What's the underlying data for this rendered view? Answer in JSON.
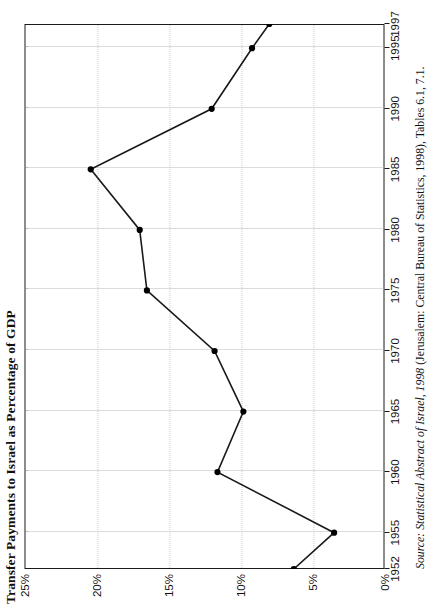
{
  "chart_data": {
    "type": "line",
    "title": "Transfer Payments to Israel as Percentage of GDP",
    "xlabel": "",
    "ylabel": "",
    "x": [
      1952,
      1955,
      1960,
      1965,
      1970,
      1975,
      1980,
      1985,
      1990,
      1995,
      1997
    ],
    "values": [
      6.3,
      3.5,
      11.6,
      9.8,
      11.8,
      16.5,
      17.0,
      20.4,
      12.0,
      9.2,
      8.0
    ],
    "xticks": [
      "1952",
      "1955",
      "1960",
      "1965",
      "1970",
      "1975",
      "1980",
      "1985",
      "1990",
      "1995",
      "1997"
    ],
    "yticks": [
      "0%",
      "5%",
      "10%",
      "15%",
      "20%",
      "25%"
    ],
    "ytick_values": [
      0,
      5,
      10,
      15,
      20,
      25
    ],
    "ylim": [
      0,
      25
    ],
    "xlim": [
      1952,
      1997
    ],
    "grid": true,
    "legend": "none",
    "orientation": "rotated-90-ccw",
    "marker": "filled-circle",
    "line_color": "#1a1a1a",
    "marker_color": "#000000",
    "grid_color": "#b9b9b9"
  },
  "source": {
    "label": "Source:",
    "italic_title": "Statistical Abstract of Israel, 1998",
    "rest": " (Jerusalem: Central Bureau of Statistics, 1998), Tables 6.1, 7.1."
  }
}
